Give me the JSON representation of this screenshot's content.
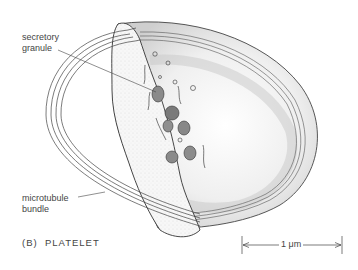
{
  "labels": {
    "secretory_granule_line1": "secretory",
    "secretory_granule_line2": "granule",
    "microtubule_bundle_line1": "microtubule",
    "microtubule_bundle_line2": "bundle"
  },
  "caption": "(B)  PLATELET",
  "scale_bar": {
    "label": "1 μm"
  },
  "colors": {
    "ink": "#3a3a3a",
    "shade": "#bdbdbd",
    "background": "#ffffff"
  }
}
